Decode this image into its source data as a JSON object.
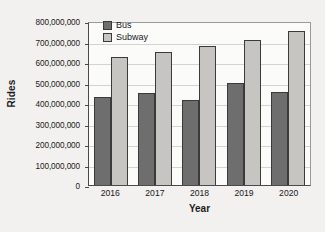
{
  "chart_data": {
    "type": "bar",
    "title": "",
    "xlabel": "Year",
    "ylabel": "Rides",
    "categories": [
      "2016",
      "2017",
      "2018",
      "2019",
      "2020"
    ],
    "series": [
      {
        "name": "Bus",
        "color": "#6e6e6e",
        "values": [
          430000000,
          450000000,
          415000000,
          498000000,
          452000000
        ]
      },
      {
        "name": "Subway",
        "color": "#c6c5c2",
        "values": [
          625000000,
          650000000,
          677000000,
          706000000,
          751000000
        ]
      }
    ],
    "ylim": [
      0,
      800000000
    ],
    "ytick_values": [
      0,
      100000000,
      200000000,
      300000000,
      400000000,
      500000000,
      600000000,
      700000000,
      800000000
    ],
    "ytick_labels": [
      "0",
      "100,000,000",
      "200,000,000",
      "300,000,000",
      "400,000,000",
      "500,000,000",
      "600,000,000",
      "700,000,000",
      "800,000,000"
    ],
    "grid": true,
    "legend_position": "top-left",
    "legend": [
      "Bus",
      "Subway"
    ]
  }
}
